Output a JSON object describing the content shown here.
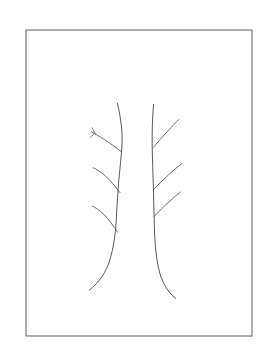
{
  "artwork": {
    "title": "Two bare tree trunks",
    "medium": "pencil line drawing",
    "subject": "winter trees without leaves",
    "background_color": "#ffffff",
    "ink_color": "#5a5a5a",
    "frame_color": "#6e6e6e"
  },
  "canvas": {
    "width": 271,
    "height": 359
  },
  "frame": {
    "name": "border-rectangle",
    "x": 26,
    "y": 30,
    "width": 226,
    "height": 306,
    "stroke_width": 1.1,
    "color": "#6e6e6e"
  },
  "strokes": {
    "left_trunk": {
      "label": "left tree trunk",
      "path": "M117.5,103.5 C120.8,118.0 122.6,131.5 122.0,144.0 C121.4,157.0 119.6,170.5 118.5,183.5 C117.4,196.5 117.0,209.0 116.2,221.5 C115.4,234.5 113.6,247.5 110.0,259.5 C106.2,272.0 100.0,281.5 89.2,290.2",
      "stroke_width": 1.0
    },
    "right_trunk": {
      "label": "right tree trunk",
      "path": "M153.5,104.5 C152.3,119.0 152.0,133.0 152.2,146.5 C152.4,160.5 153.0,174.0 153.4,187.5 C153.8,201.0 154.0,214.5 154.4,228.0 C154.8,242.0 155.8,256.0 158.6,268.5 C161.4,281.0 166.6,291.0 175.6,298.4",
      "stroke_width": 1.0
    },
    "left_branches": [
      {
        "label": "upper-left drooping branch",
        "path": "M121.6,151.8 C116.0,147.4 110.0,143.2 104.4,139.6 C99.4,136.4 95.0,133.8 91.4,131.8",
        "stroke_width": 0.9
      },
      {
        "label": "upper-left branch forked twig upper",
        "path": "M95.6,134.2 C94.0,132.0 93.0,130.0 92.4,127.8",
        "stroke_width": 0.8
      },
      {
        "label": "upper-left branch forked twig lower",
        "path": "M94.2,133.6 C92.6,134.8 91.4,136.0 90.2,137.4",
        "stroke_width": 0.8
      },
      {
        "label": "middle-left drooping branch",
        "path": "M120.0,192.6 C115.0,186.0 110.0,180.0 105.0,175.6 C100.0,171.2 96.0,169.0 93.2,167.8",
        "stroke_width": 0.9
      },
      {
        "label": "lower-left drooping branch",
        "path": "M117.4,232.0 C113.0,225.4 108.6,219.2 104.0,214.6 C99.2,209.8 95.0,207.2 92.4,206.2",
        "stroke_width": 0.9
      }
    ],
    "right_branches": [
      {
        "label": "upper-right ascending branch",
        "path": "M153.0,147.8 C158.0,142.0 163.0,136.2 168.0,130.8 C172.6,125.8 176.0,122.2 178.6,119.6",
        "stroke_width": 0.9
      },
      {
        "label": "middle-right ascending branch",
        "path": "M153.2,189.8 C158.6,184.2 164.0,179.0 169.0,174.4 C174.2,169.6 178.4,166.2 181.6,163.8",
        "stroke_width": 0.9
      },
      {
        "label": "lower-right ascending branch",
        "path": "M154.2,216.4 C159.0,211.2 164.0,206.2 169.0,201.8 C173.8,197.4 177.6,194.2 180.4,192.0",
        "stroke_width": 0.9
      }
    ]
  }
}
